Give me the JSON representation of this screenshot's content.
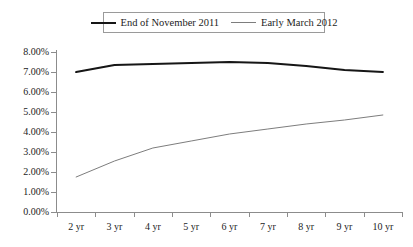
{
  "chart_data": {
    "type": "line",
    "title": "",
    "xlabel": "",
    "ylabel": "",
    "categories": [
      "2 yr",
      "3 yr",
      "4 yr",
      "5 yr",
      "6 yr",
      "7 yr",
      "8 yr",
      "9 yr",
      "10 yr"
    ],
    "series": [
      {
        "name": "End of November 2011",
        "values": [
          7.0,
          7.35,
          7.4,
          7.45,
          7.5,
          7.45,
          7.3,
          7.1,
          7.0
        ],
        "color": "#161616",
        "width": 2.2,
        "style": "thick"
      },
      {
        "name": "Early March 2012",
        "values": [
          1.75,
          2.55,
          3.2,
          3.55,
          3.9,
          4.15,
          4.4,
          4.6,
          4.85
        ],
        "color": "#7d7d7d",
        "width": 1.0,
        "style": "thin"
      }
    ],
    "ylim": [
      0,
      8
    ],
    "ytick_values": [
      8,
      7,
      6,
      5,
      4,
      3,
      2,
      1,
      0
    ],
    "ytick_labels": [
      "8.00%",
      "7.00%",
      "6.00%",
      "5.00%",
      "4.00%",
      "3.00%",
      "2.00%",
      "1.00%",
      "0.00%"
    ],
    "grid": false,
    "legend_position": "top-center",
    "value_suffix": "%"
  },
  "legend": {
    "entries": [
      {
        "label": "End of November 2011"
      },
      {
        "label": "Early March 2012"
      }
    ]
  }
}
